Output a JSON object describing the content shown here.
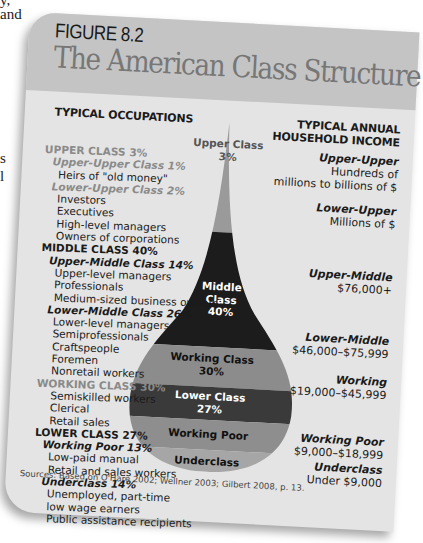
{
  "book_fragments": [
    "y,",
    "and",
    "s",
    "l"
  ],
  "figure": {
    "label": "FIGURE 8.2",
    "title": "The American Class Structure",
    "left_heading": "TYPICAL OCCUPATIONS",
    "right_heading_line1": "TYPICAL ANNUAL",
    "right_heading_line2": "HOUSEHOLD INCOME",
    "sources": "Sources: Based on O'Hare 2002; Wellner 2003; Gilbert 2008, p. 13."
  },
  "occupations": [
    {
      "type": "cls",
      "tone": "grey",
      "text": "UPPER CLASS  3%"
    },
    {
      "type": "sub",
      "tone": "grey",
      "text": "Upper-Upper Class  1%"
    },
    {
      "type": "item",
      "text": "Heirs of \"old money\""
    },
    {
      "type": "sub",
      "tone": "grey",
      "text": "Lower-Upper Class  2%"
    },
    {
      "type": "item",
      "text": "Investors"
    },
    {
      "type": "item",
      "text": "Executives"
    },
    {
      "type": "item",
      "text": "High-level managers"
    },
    {
      "type": "item",
      "text": "Owners of corporations"
    },
    {
      "type": "cls",
      "tone": "dark",
      "text": "MIDDLE CLASS  40%"
    },
    {
      "type": "sub",
      "tone": "dark",
      "text": "Upper-Middle Class  14%"
    },
    {
      "type": "item",
      "text": "Upper-level managers"
    },
    {
      "type": "item",
      "text": "Professionals"
    },
    {
      "type": "item",
      "text": "Medium-sized business owners"
    },
    {
      "type": "sub",
      "tone": "dark",
      "text": "Lower-Middle Class  26%"
    },
    {
      "type": "item",
      "text": "Lower-level managers"
    },
    {
      "type": "item",
      "text": "Semiprofessionals"
    },
    {
      "type": "item",
      "text": "Craftspeople"
    },
    {
      "type": "item",
      "text": "Foremen"
    },
    {
      "type": "item",
      "text": "Nonretail workers"
    },
    {
      "type": "cls",
      "tone": "grey",
      "text": "WORKING CLASS  30%"
    },
    {
      "type": "item",
      "text": "Semiskilled workers"
    },
    {
      "type": "item",
      "text": "Clerical"
    },
    {
      "type": "item",
      "text": "Retail sales"
    },
    {
      "type": "cls",
      "tone": "dark",
      "text": "LOWER CLASS  27%"
    },
    {
      "type": "sub",
      "tone": "dark",
      "text": "Working Poor  13%"
    },
    {
      "type": "item",
      "text": "Low-paid manual"
    },
    {
      "type": "item",
      "text": "Retail and sales workers"
    },
    {
      "type": "sub",
      "tone": "dark",
      "text": "Underclass  14%"
    },
    {
      "type": "item",
      "text": "Unemployed, part-time"
    },
    {
      "type": "item",
      "text": "low wage earners"
    },
    {
      "type": "item",
      "text": "Public assistance recipients"
    }
  ],
  "income": [
    {
      "label": "Upper-Upper",
      "lines": [
        "Hundreds of",
        "millions to billions of $"
      ]
    },
    {
      "label": "Lower-Upper",
      "lines": [
        "Millions of $"
      ]
    },
    {
      "label": "Upper-Middle",
      "lines": [
        "$76,000+"
      ]
    },
    {
      "label": "Lower-Middle",
      "lines": [
        "$46,000–$75,999"
      ]
    },
    {
      "label": "Working",
      "lines": [
        "$19,000–$45,999"
      ]
    },
    {
      "label": "Working Poor",
      "lines": [
        "$9,000–$18,999"
      ]
    },
    {
      "label": "Underclass",
      "lines": [
        "Under $9,000"
      ]
    }
  ],
  "teardrop": {
    "bands": [
      {
        "name": "Upper Class",
        "pct": "3%",
        "color": "#9a9a9a",
        "text_color": "#333333"
      },
      {
        "name": "Middle Class",
        "pct": "40%",
        "color": "#1c1c1c",
        "text_color": "#ffffff"
      },
      {
        "name": "Working Class",
        "pct": "30%",
        "color": "#8c8c8c",
        "text_color": "#111111"
      },
      {
        "name": "Lower Class",
        "pct": "27%",
        "color": "#3a3a3a",
        "text_color": "#ffffff"
      },
      {
        "name": "Working Poor",
        "pct": "",
        "color": "#8e8e8e",
        "text_color": "#111111"
      },
      {
        "name": "Underclass",
        "pct": "",
        "color": "#a6a6a6",
        "text_color": "#111111"
      }
    ],
    "labels": {
      "upper_l1": "Upper Class",
      "upper_l2": "3%",
      "middle_l1": "Middle",
      "middle_l2": "Class",
      "middle_l3": "40%",
      "working_l1": "Working Class",
      "working_l2": "30%",
      "lower_l1": "Lower Class",
      "lower_l2": "27%",
      "poor_l1": "Working Poor",
      "under_l1": "Underclass"
    }
  }
}
